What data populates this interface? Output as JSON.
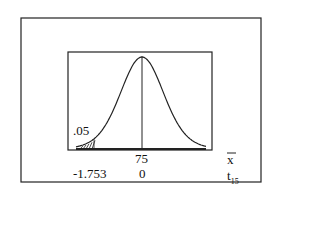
{
  "chart_data": {
    "type": "area",
    "title": "",
    "tail_area_label": ".05",
    "axes": [
      {
        "name": "x-bar",
        "label": "x̄",
        "ticks": [
          {
            "position": 0,
            "label": "75"
          }
        ]
      },
      {
        "name": "t15",
        "label": "t",
        "subscript": "15",
        "ticks": [
          {
            "position": -1.753,
            "label": "-1.753"
          },
          {
            "position": 0,
            "label": "0"
          }
        ]
      }
    ],
    "critical_value": -1.753,
    "alpha": 0.05,
    "df": 15,
    "center_xbar": 75,
    "shaded_region": "left tail"
  },
  "labels": {
    "alpha": ".05",
    "xbar_tick": "75",
    "t_crit": "-1.753",
    "t_zero": "0",
    "xbar_axis": "x",
    "t_axis": "t",
    "t_sub": "15"
  }
}
